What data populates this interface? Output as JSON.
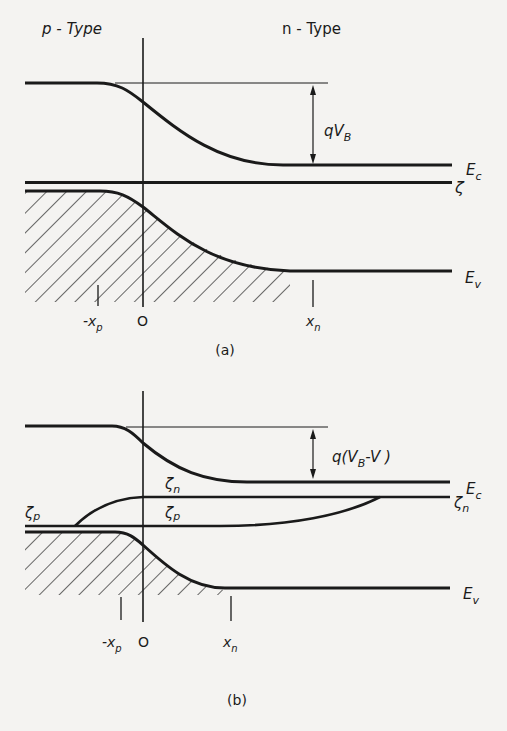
{
  "diagram": {
    "panel_a": {
      "caption": "(a)",
      "region_left_label": "p - Type",
      "region_right_label": "n - Type",
      "barrier_label": "qV_B",
      "barrier_label_main": "qV",
      "barrier_label_sub": "B",
      "band_labels": {
        "conduction": "E",
        "conduction_sub": "c",
        "fermi": "ζ",
        "valence": "E",
        "valence_sub": "v"
      },
      "axis_labels": {
        "neg_xp": "-x",
        "neg_xp_sub": "p",
        "origin": "O",
        "xn": "x",
        "xn_sub": "n"
      }
    },
    "panel_b": {
      "caption": "(b)",
      "barrier_label": "q(V_B - V)",
      "barrier_label_pre": "q(V",
      "barrier_label_sub": "B",
      "barrier_label_post": "-V )",
      "quasi_fermi_labels": {
        "zeta_p_left": "ζ",
        "zeta_p_left_sub": "p",
        "zeta_n_mid": "ζ",
        "zeta_n_mid_sub": "n",
        "zeta_p_mid": "ζ",
        "zeta_p_mid_sub": "p",
        "zeta_n_right": "ζ",
        "zeta_n_right_sub": "n"
      },
      "band_labels": {
        "conduction": "E",
        "conduction_sub": "c",
        "valence": "E",
        "valence_sub": "v"
      },
      "axis_labels": {
        "neg_xp": "-x",
        "neg_xp_sub": "p",
        "origin": "O",
        "xn": "x",
        "xn_sub": "n"
      }
    },
    "colors": {
      "ink": "#1a1a1a",
      "paper": "#f4f3f1"
    }
  }
}
